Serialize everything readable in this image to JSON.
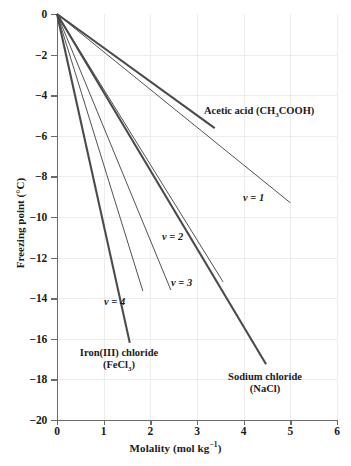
{
  "chart_data": {
    "type": "line",
    "title": "",
    "xlabel": "Molality (mol kg⁻¹)",
    "ylabel": "Freezing point (°C)",
    "xlim": [
      0,
      6
    ],
    "ylim": [
      -20,
      0
    ],
    "xticks": [
      "0",
      "1",
      "2",
      "3",
      "4",
      "5",
      "6"
    ],
    "yticks": [
      "0",
      "−2",
      "−4",
      "−6",
      "−8",
      "−10",
      "−12",
      "−14",
      "−16",
      "−18",
      "−20"
    ],
    "grid": true,
    "legend": "inline-annotations",
    "series": [
      {
        "name": "ν = 1",
        "label": "ν = 1",
        "style": "thin",
        "color": "#3d3d3d",
        "x": [
          0,
          5.0
        ],
        "y": [
          0,
          -9.3
        ]
      },
      {
        "name": "Acetic acid (CH3COOH)",
        "label": "Acetic acid (CH₃COOH)",
        "style": "thick",
        "color": "#4a4a4a",
        "x": [
          0,
          3.38
        ],
        "y": [
          0,
          -5.62
        ]
      },
      {
        "name": "ν = 2",
        "label": "ν = 2",
        "style": "thin",
        "color": "#3d3d3d",
        "x": [
          0,
          3.56
        ],
        "y": [
          0,
          -13.2
        ]
      },
      {
        "name": "Sodium chloride (NaCl)",
        "label": "Sodium chloride (NaCl)",
        "style": "thick",
        "color": "#4a4a4a",
        "x": [
          0,
          4.48
        ],
        "y": [
          0,
          -17.25
        ]
      },
      {
        "name": "ν = 3",
        "label": "ν = 3",
        "style": "thin",
        "color": "#3d3d3d",
        "x": [
          0,
          2.44
        ],
        "y": [
          0,
          -13.6
        ]
      },
      {
        "name": "ν = 4",
        "label": "ν = 4",
        "style": "thin",
        "color": "#3d3d3d",
        "x": [
          0,
          1.84
        ],
        "y": [
          0,
          -13.65
        ]
      },
      {
        "name": "Iron(III) chloride (FeCl3)",
        "label": "Iron(III) chloride (FeCl₃)",
        "style": "thick",
        "color": "#4a4a4a",
        "x": [
          0,
          1.56
        ],
        "y": [
          0,
          -16.2
        ]
      }
    ],
    "annotations": [
      {
        "name": "acetic-acid",
        "text_line1": "Acetic acid (CH",
        "sub1": "3",
        "text_line2": "COOH)"
      },
      {
        "name": "nu-1",
        "text": "ν = 1"
      },
      {
        "name": "nu-2",
        "text": "ν = 2"
      },
      {
        "name": "nu-3",
        "text": "ν = 3"
      },
      {
        "name": "nu-4",
        "text": "ν = 4"
      },
      {
        "name": "iron-chloride-line1",
        "text": "Iron(III) chloride"
      },
      {
        "name": "iron-chloride-line2",
        "text": "(FeCl",
        "sub": "3",
        "tail": ")"
      },
      {
        "name": "sodium-chloride-line1",
        "text": "Sodium chloride"
      },
      {
        "name": "sodium-chloride-line2",
        "text": "(NaCl)"
      }
    ]
  },
  "axes": {
    "x_title_main": "Molality  (mol kg",
    "x_title_sup": "−1",
    "x_title_tail": ")",
    "y_title": "Freezing point (°C)"
  },
  "labels": {
    "acetic_pre": "Acetic acid (CH",
    "acetic_sub": "3",
    "acetic_post": "COOH)",
    "nu1": "ν = 1",
    "nu2": "ν = 2",
    "nu3": "ν = 3",
    "nu4": "ν = 4",
    "iron_l1": "Iron(III) chloride",
    "iron_l2_pre": "(FeCl",
    "iron_l2_sub": "3",
    "iron_l2_post": ")",
    "nacl_l1": "Sodium chloride",
    "nacl_l2": "(NaCl)"
  },
  "colors": {
    "axis": "#6b6b6b",
    "grid": "#ededed",
    "line_thin": "#3d3d3d",
    "line_thick": "#4a4a4a",
    "text": "#1a1a1a"
  }
}
